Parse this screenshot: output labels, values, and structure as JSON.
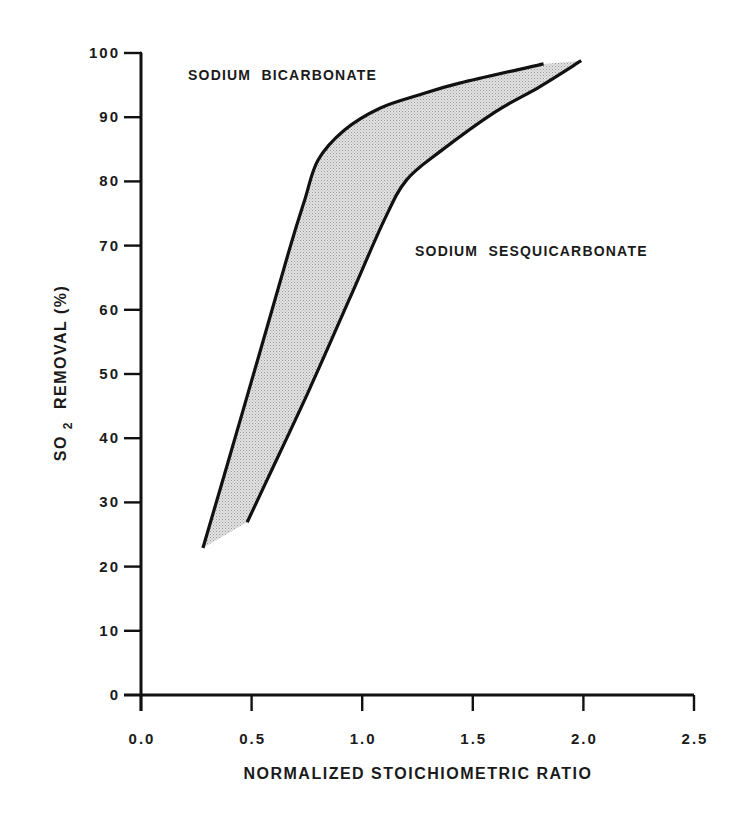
{
  "chart_data": {
    "type": "area",
    "title": "",
    "xlabel": "NORMALIZED STOICHIOMETRIC RATIO",
    "ylabel_parts": {
      "main": "SO",
      "sub": "2",
      "rest": "REMOVAL (%)"
    },
    "ylabel": "SO2 REMOVAL (%)",
    "xlim": [
      0,
      2.5
    ],
    "ylim": [
      0,
      100
    ],
    "x_ticks": [
      0.0,
      0.5,
      1.0,
      1.5,
      2.0,
      2.5
    ],
    "x_tick_labels": [
      "0.0",
      "0.5",
      "1.0",
      "1.5",
      "2.0",
      "2.5"
    ],
    "y_ticks": [
      0,
      10,
      20,
      30,
      40,
      50,
      60,
      70,
      80,
      90,
      100
    ],
    "y_tick_labels": [
      "0",
      "10",
      "20",
      "30",
      "40",
      "50",
      "60",
      "70",
      "80",
      "90",
      "100"
    ],
    "grid": false,
    "legend": null,
    "fill_between_series": true,
    "fill_color": "#d4d4d4",
    "line_color": "#111111",
    "series": [
      {
        "name": "SODIUM BICARBONATE",
        "x": [
          0.28,
          0.37,
          0.54,
          0.67,
          0.74,
          0.8,
          0.92,
          1.08,
          1.26,
          1.44,
          1.82
        ],
        "y": [
          22.9,
          33.5,
          53.7,
          69.3,
          77.1,
          83.3,
          88.0,
          91.4,
          93.5,
          95.3,
          98.3
        ]
      },
      {
        "name": "SODIUM SESQUICARBONATE",
        "x": [
          0.48,
          0.57,
          0.76,
          0.94,
          1.1,
          1.2,
          1.35,
          1.6,
          1.8,
          1.99
        ],
        "y": [
          26.9,
          33.5,
          47.5,
          61.5,
          74.0,
          80.2,
          84.6,
          90.8,
          94.7,
          98.8
        ]
      }
    ],
    "annotations": [
      {
        "text": "SODIUM  BICARBONATE",
        "x_px": 188,
        "y_px": 80
      },
      {
        "text": "SODIUM  SESQUICARBONATE",
        "x_px": 415,
        "y_px": 256
      }
    ]
  }
}
